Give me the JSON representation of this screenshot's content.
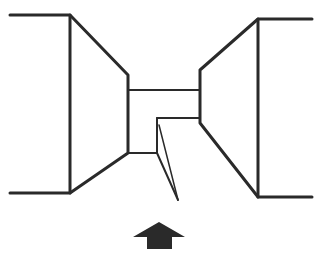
{
  "diagram": {
    "stroke_color": "#2a2a2a",
    "background": "#ffffff",
    "arrow_color": "#2a2a2a",
    "arrow_direction": "up"
  }
}
